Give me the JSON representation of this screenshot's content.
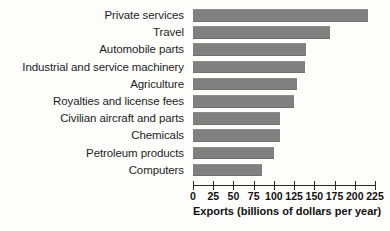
{
  "chart_data": {
    "type": "bar",
    "orientation": "horizontal",
    "title": "",
    "xlabel": "Exports (billions of dollars per year)",
    "ylabel": "",
    "xlim": [
      0,
      225
    ],
    "xticks": [
      0,
      25,
      50,
      75,
      100,
      125,
      150,
      175,
      200,
      225
    ],
    "grid": false,
    "legend": null,
    "bar_color": "#808080",
    "categories": [
      "Private services",
      "Travel",
      "Automobile parts",
      "Industrial and service machinery",
      "Agriculture",
      "Royalties and license fees",
      "Civilian aircraft and parts",
      "Chemicals",
      "Petroleum products",
      "Computers"
    ],
    "values": [
      216,
      169,
      140,
      139,
      128,
      125,
      107,
      107,
      100,
      85
    ]
  }
}
